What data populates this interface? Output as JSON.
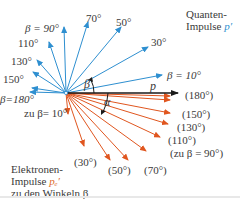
{
  "colors": {
    "photon": "#2e8fd0",
    "electron": "#e0561f",
    "incident": "#1a1a1a",
    "text": "#3a3a3a"
  },
  "origin": {
    "x": 66,
    "y": 93
  },
  "incident": {
    "label": "p",
    "end": {
      "x": 178,
      "y": 93
    }
  },
  "photon_arrows": [
    {
      "angle": 10,
      "end": [
        162,
        75
      ]
    },
    {
      "angle": 30,
      "end": [
        148,
        47
      ]
    },
    {
      "angle": 50,
      "end": [
        121,
        27
      ]
    },
    {
      "angle": 70,
      "end": [
        88,
        22
      ]
    },
    {
      "angle": 90,
      "end": [
        64,
        27
      ]
    },
    {
      "angle": 110,
      "end": [
        49,
        42
      ]
    },
    {
      "angle": 130,
      "end": [
        37,
        60
      ]
    },
    {
      "angle": 150,
      "end": [
        33,
        72
      ]
    },
    {
      "angle": 170,
      "end": [
        32,
        88
      ]
    },
    {
      "angle": 180,
      "end": [
        30,
        92
      ]
    }
  ],
  "electron_arrows": [
    {
      "angle": 180,
      "end": [
        170,
        96
      ]
    },
    {
      "angle": 170,
      "end": [
        170,
        100
      ]
    },
    {
      "angle": 150,
      "end": [
        170,
        113
      ]
    },
    {
      "angle": 130,
      "end": [
        168,
        124
      ]
    },
    {
      "angle": 110,
      "end": [
        160,
        137
      ]
    },
    {
      "angle": 90,
      "end": [
        146,
        151
      ]
    },
    {
      "angle": 70,
      "end": [
        128,
        160
      ]
    },
    {
      "angle": 50,
      "end": [
        110,
        160
      ]
    },
    {
      "angle": 30,
      "end": [
        84,
        146
      ]
    },
    {
      "angle": 10,
      "end": [
        68,
        114
      ]
    }
  ],
  "labels": {
    "beta90": "β = 90°",
    "l70": "70°",
    "l50": "50°",
    "l30": "30°",
    "l110": "110°",
    "l130": "130°",
    "l150": "150°",
    "beta180": "β=180°",
    "beta10": "β = 10°",
    "zu_beta10": "zu β= 10°",
    "beta_angle": "β",
    "alpha_angle": "α",
    "p": "p",
    "e180": "(180°)",
    "e150": "(150°)",
    "e130": "(130°)",
    "e110": "(110°)",
    "e90": "(zu β = 90°)",
    "e70": "(70°)",
    "e50": "(50°)",
    "e30": "(30°)"
  },
  "legend_photon": {
    "line1": "Quanten-",
    "line2": "Impulse",
    "symbol": "p′"
  },
  "legend_electron": {
    "line1": "Elektronen-",
    "line2": "Impulse",
    "symbol": "pₑ′",
    "line3": "zu den Winkeln β"
  }
}
